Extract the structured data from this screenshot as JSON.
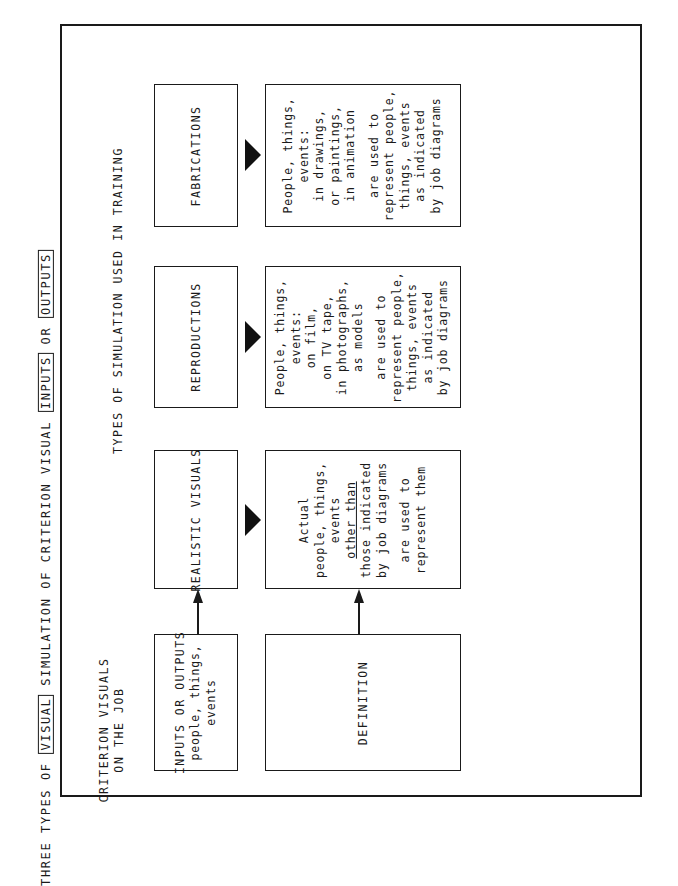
{
  "title": {
    "prefix": "THREE TYPES OF",
    "boxed_1": "VISUAL",
    "middle": "SIMULATION OF CRITERION VISUAL",
    "boxed_2": "INPUTS",
    "connector": "OR",
    "boxed_3": "OUTPUTS"
  },
  "criterion_heading": {
    "line1": "CRITERION VISUALS",
    "line2": "ON THE JOB"
  },
  "simulation_heading": "TYPES OF SIMULATION USED IN TRAINING",
  "criterion_column": {
    "top_box": {
      "label": "INPUTS OR OUTPUTS",
      "line2": "people, things,",
      "line3": "events"
    },
    "bottom_box": {
      "label": "DEFINITION"
    }
  },
  "simulation_types": [
    {
      "heading": "REALISTIC VISUALS",
      "definition": {
        "lines": [
          "Actual",
          "people, things,",
          "events"
        ],
        "underlined": [
          "other than",
          "those indicated"
        ],
        "lines_after": [
          "by job diagrams"
        ],
        "closing": [
          "are used to",
          "represent them"
        ]
      }
    },
    {
      "heading": "REPRODUCTIONS",
      "definition": {
        "lines": [
          "People, things,",
          "events:",
          "on film,",
          "on TV tape,",
          "in photographs,",
          "as models"
        ],
        "closing": [
          "are used to",
          "represent people,",
          "things, events",
          "as indicated",
          "by job diagrams"
        ]
      }
    },
    {
      "heading": "FABRICATIONS",
      "definition": {
        "lines": [
          "People, things,",
          "events:",
          "in drawings,",
          "or paintings,",
          "in animation"
        ],
        "closing": [
          "are used to",
          "represent people,",
          "things, events",
          "as indicated",
          "by job diagrams"
        ]
      }
    }
  ],
  "colors": {
    "ink": "#1a1a1a",
    "paper": "#ffffff"
  }
}
